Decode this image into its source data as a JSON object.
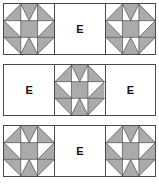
{
  "diagram": {
    "background_color": "#ffffff",
    "line_color": "#4a4a4a",
    "star_fill_color": "#ababab",
    "star_background_color": "#ffffff",
    "label_color": "#111111",
    "rows": [
      {
        "id": "row-1",
        "cells": [
          {
            "type": "star",
            "label": ""
          },
          {
            "type": "plain",
            "label": "E"
          },
          {
            "type": "star",
            "label": ""
          }
        ]
      },
      {
        "id": "row-2",
        "cells": [
          {
            "type": "plain",
            "label": "E"
          },
          {
            "type": "star",
            "label": ""
          },
          {
            "type": "plain",
            "label": "E"
          }
        ]
      },
      {
        "id": "row-3",
        "cells": [
          {
            "type": "star",
            "label": ""
          },
          {
            "type": "plain",
            "label": "E"
          },
          {
            "type": "star",
            "label": ""
          }
        ]
      }
    ],
    "star_block": {
      "name": "sawtooth-star",
      "grid": "3x3",
      "corner_fill": "#ffffff",
      "point_fill": "#ababab",
      "center_fill": "#ababab"
    }
  }
}
